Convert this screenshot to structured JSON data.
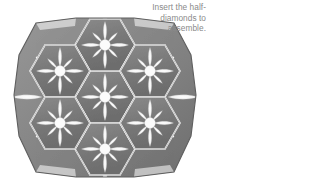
{
  "figure": {
    "name": "hexagon-star-quilt-medallion",
    "colors": {
      "hexagon_fill": "#7e7e7e",
      "hexagon_fill_dark": "#6e6e6e",
      "half_diamond_fill": "#8c8c8c",
      "star_petal": "#f2f2f2",
      "seam_line": "#ffffff",
      "outline": "#5a5a5a",
      "background": "#ffffff",
      "caption_text": "#8a8a8a"
    },
    "hexagon_count": 7,
    "star_points": 8,
    "half_diamond_count": 12
  },
  "caption": {
    "text": "Insert the half-diamonds to assemble.",
    "line1": "Insert the half-",
    "line2": "diamonds to",
    "line3": "assemble."
  }
}
